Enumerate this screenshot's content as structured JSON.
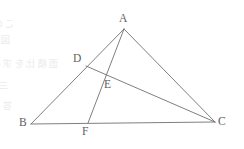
{
  "figure": {
    "type": "euclidean-geometry-diagram",
    "stroke_color": "#6f7173",
    "label_color": "#5d5f61",
    "background_color": "#ffffff",
    "canvas": {
      "width": 244,
      "height": 149
    },
    "points": [
      {
        "id": "A",
        "label": "A",
        "x": 124,
        "y": 29,
        "label_x": 119,
        "label_y": 13,
        "role": "apex-vertex"
      },
      {
        "id": "B",
        "label": "B",
        "x": 31,
        "y": 124,
        "label_x": 19,
        "label_y": 117,
        "role": "base-left-vertex"
      },
      {
        "id": "C",
        "label": "C",
        "x": 215,
        "y": 122,
        "label_x": 218,
        "label_y": 116,
        "role": "base-right-vertex"
      },
      {
        "id": "D",
        "label": "D",
        "x": 86,
        "y": 66,
        "label_x": 73,
        "label_y": 53,
        "role": "point-on-AB"
      },
      {
        "id": "E",
        "label": "E",
        "x": 105,
        "y": 74,
        "label_x": 104,
        "label_y": 79,
        "role": "intersection-AF-DC"
      },
      {
        "id": "F",
        "label": "F",
        "x": 88,
        "y": 123,
        "label_x": 82,
        "label_y": 126,
        "role": "point-on-BC"
      }
    ],
    "segments": [
      {
        "id": "AB",
        "from": "A",
        "to": "B",
        "name": "side-ab"
      },
      {
        "id": "AC",
        "from": "A",
        "to": "C",
        "name": "side-ac"
      },
      {
        "id": "BC",
        "from": "B",
        "to": "C",
        "name": "side-bc"
      },
      {
        "id": "AF",
        "from": "A",
        "to": "F",
        "name": "cevian-af"
      },
      {
        "id": "DC",
        "from": "D",
        "to": "C",
        "name": "cevian-dc"
      }
    ],
    "bleed_through_text": [
      {
        "text": "この問題は二つの",
        "x": 14,
        "y": 16
      },
      {
        "text": "図形の性質を用いて",
        "x": 10,
        "y": 32
      },
      {
        "text": "面積比を求める",
        "x": 58,
        "y": 56
      },
      {
        "text": "三角形の分割について",
        "x": 8,
        "y": 78
      },
      {
        "text": "答えよ",
        "x": 12,
        "y": 98
      }
    ]
  }
}
